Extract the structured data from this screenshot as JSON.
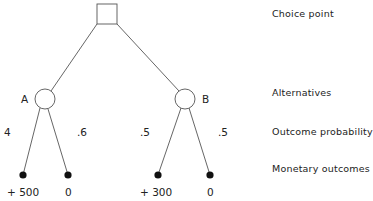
{
  "diagram": {
    "type": "decision-tree",
    "choice_node": {
      "shape": "square"
    },
    "alternatives": [
      {
        "label": "A",
        "outcomes": [
          {
            "probability": "4",
            "value": "+ 500"
          },
          {
            "probability": ".6",
            "value": "0"
          }
        ]
      },
      {
        "label": "B",
        "outcomes": [
          {
            "probability": ".5",
            "value": "+ 300"
          },
          {
            "probability": ".5",
            "value": "0"
          }
        ]
      }
    ],
    "legend": {
      "choice_point": "Choice point",
      "alternatives": "Alternatives",
      "outcome_probability": "Outcome probability",
      "monetary_outcomes": "Monetary outcomes"
    },
    "colors": {
      "line": "#555555",
      "dot": "#111111",
      "text": "#222222"
    }
  }
}
